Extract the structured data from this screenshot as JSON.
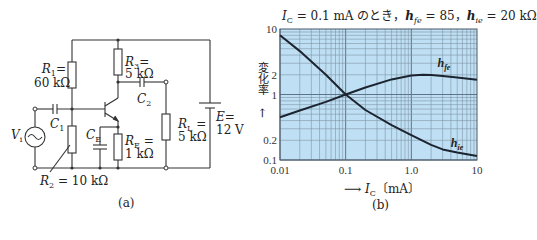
{
  "figure_a": {
    "caption": "(a)",
    "components": {
      "R1": {
        "name": "R",
        "sub": "1",
        "value": "60 kΩ",
        "eq": "="
      },
      "R2": {
        "name": "R",
        "sub": "2",
        "value": "10 kΩ",
        "eq": " = "
      },
      "R3": {
        "name": "R",
        "sub": "3",
        "value": "5 kΩ",
        "eq": "="
      },
      "RE": {
        "name": "R",
        "sub": "E",
        "value": "1 kΩ",
        "eq": " ="
      },
      "RL": {
        "name": "R",
        "sub": "L",
        "value": "5 kΩ",
        "eq": " ="
      },
      "C1": {
        "name": "C",
        "sub": "1"
      },
      "C2": {
        "name": "C",
        "sub": "2"
      },
      "CE": {
        "name": "C",
        "sub": "E"
      },
      "Vi": {
        "name": "V",
        "sub": "i"
      },
      "E": {
        "name": "E",
        "eq": "=",
        "value": "12 V"
      }
    }
  },
  "figure_b": {
    "caption": "(b)",
    "title_parts": {
      "ic": "I",
      "ic_sub": "C",
      "ic_val": " = 0.1 mA のとき，",
      "hfe": "h",
      "hfe_sub": "fe",
      "hfe_val": " = 85，",
      "hie": "h",
      "hie_sub": "ie",
      "hie_val": " = 20 kΩ"
    },
    "ylabel": "変化率",
    "ylabel_arrow": "→",
    "xlabel_arrow": "⟶",
    "xlabel_var": "I",
    "xlabel_sub": "C",
    "xlabel_unit": "〔mA〕",
    "colors": {
      "plot_bg": "#bfe0f4",
      "grid_major": "#5f7488",
      "grid_minor": "#7f93a5",
      "curve": "#1c2430"
    }
  },
  "chart_data": {
    "type": "line",
    "xlabel": "I_C [mA]",
    "ylabel": "変化率",
    "xscale": "log",
    "yscale": "log",
    "xlim": [
      0.01,
      10
    ],
    "ylim": [
      0.1,
      10
    ],
    "x_ticks": [
      "0.01",
      "0.1",
      "1.0",
      "10"
    ],
    "y_ticks": [
      "0.1",
      "0.2",
      "1",
      "2",
      "10"
    ],
    "grid": true,
    "series": [
      {
        "name": "h_fe",
        "x": [
          0.01,
          0.02,
          0.05,
          0.1,
          0.2,
          0.5,
          1.0,
          1.5,
          2.0,
          3.0,
          5.0,
          10.0
        ],
        "values": [
          0.45,
          0.57,
          0.77,
          1.0,
          1.28,
          1.7,
          1.95,
          2.0,
          1.98,
          1.92,
          1.82,
          1.68
        ]
      },
      {
        "name": "h_ie",
        "x": [
          0.01,
          0.02,
          0.05,
          0.1,
          0.2,
          0.5,
          1.0,
          2.0,
          3.0,
          5.0,
          10.0
        ],
        "values": [
          8.0,
          4.6,
          2.0,
          1.0,
          0.58,
          0.34,
          0.24,
          0.17,
          0.145,
          0.13,
          0.115
        ]
      }
    ],
    "annotations": [
      {
        "text": "h_fe",
        "x": 2.5,
        "y": 2.6
      },
      {
        "text": "h_ie",
        "x": 4.0,
        "y": 0.16
      }
    ]
  }
}
